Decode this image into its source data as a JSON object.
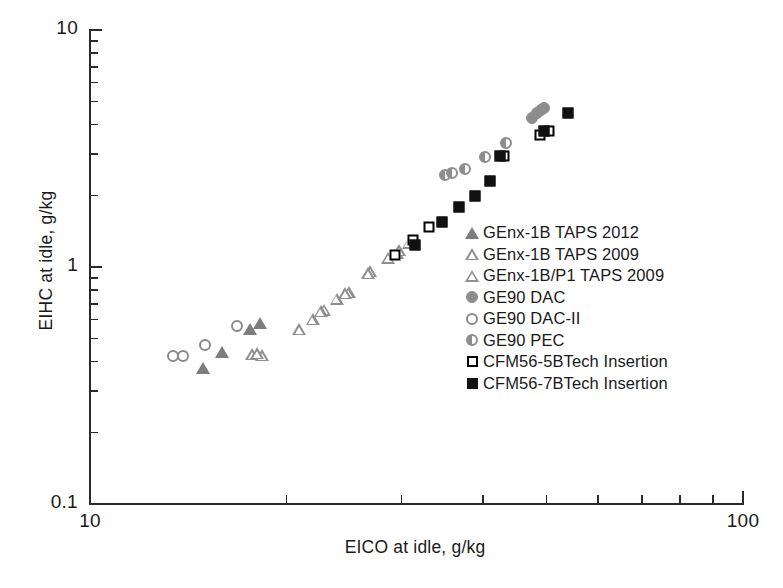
{
  "chart_data": {
    "type": "scatter",
    "title": "",
    "xlabel": "EICO at idle, g/kg",
    "ylabel": "EIHC at idle, g/kg",
    "xscale": "log",
    "yscale": "log",
    "xlim": [
      10,
      100
    ],
    "ylim": [
      0.1,
      10
    ],
    "grid": false,
    "legend_position": "center-right",
    "x_tick_labels": [
      "10",
      "100"
    ],
    "x_tick_values": [
      10,
      100
    ],
    "x_minor_ticks": [
      20,
      30,
      40,
      50,
      60,
      70,
      80,
      90
    ],
    "y_tick_labels": [
      "10",
      "1",
      "0.1"
    ],
    "y_tick_values": [
      10,
      1,
      0.1
    ],
    "y_minor_ticks": [
      0.2,
      0.3,
      0.4,
      0.5,
      0.6,
      0.7,
      0.8,
      0.9,
      2,
      3,
      4,
      5,
      6,
      7,
      8,
      9
    ],
    "series": [
      {
        "name": "GEnx-1B TAPS 2012",
        "marker": "triangle-filled",
        "color": "#7d7d7d",
        "points": [
          [
            14.9,
            0.375
          ],
          [
            15.9,
            0.44
          ],
          [
            17.6,
            0.55
          ],
          [
            18.2,
            0.58
          ]
        ]
      },
      {
        "name": "GEnx-1B TAPS 2009",
        "marker": "triangle-open",
        "color": "#8f8f8f",
        "points": [
          [
            17.3,
            0.455
          ],
          [
            17.9,
            0.45
          ],
          [
            20.4,
            0.58
          ],
          [
            21.4,
            0.64
          ],
          [
            22.3,
            0.7
          ],
          [
            23.3,
            0.78
          ],
          [
            24.3,
            0.83
          ],
          [
            26.2,
            1.02
          ],
          [
            27.9,
            1.16
          ],
          [
            30.0,
            1.34
          ]
        ]
      },
      {
        "name": "GEnx-1B/P1 TAPS 2009",
        "marker": "triangle-open",
        "color": "#8f8f8f",
        "points": [
          [
            17.6,
            0.46
          ],
          [
            22.0,
            0.69
          ],
          [
            24.0,
            0.82
          ],
          [
            26.0,
            1.0
          ],
          [
            28.8,
            1.22
          ],
          [
            29.0,
            1.25
          ]
        ]
      },
      {
        "name": "GE90 DAC",
        "marker": "circle-filled",
        "color": "#8d8d8d",
        "points": [
          [
            47.5,
            4.25
          ],
          [
            48.3,
            4.45
          ],
          [
            49.0,
            4.6
          ],
          [
            49.6,
            4.7
          ]
        ]
      },
      {
        "name": "GE90 DAC-II",
        "marker": "circle-open",
        "color": "#8a8a8a",
        "points": [
          [
            13.4,
            0.42
          ],
          [
            13.9,
            0.42
          ],
          [
            15.0,
            0.47
          ],
          [
            16.8,
            0.565
          ]
        ]
      },
      {
        "name": "GE90 PEC",
        "marker": "circle-half",
        "color": "#8d8d8d",
        "points": [
          [
            35.0,
            2.45
          ],
          [
            35.8,
            2.5
          ],
          [
            37.5,
            2.6
          ],
          [
            40.3,
            2.9
          ],
          [
            43.3,
            3.35
          ]
        ]
      },
      {
        "name": "CFM56-5BTech Insertion",
        "marker": "square-open",
        "color": "#000000",
        "points": [
          [
            29.3,
            1.12
          ],
          [
            31.2,
            1.3
          ],
          [
            33.1,
            1.47
          ],
          [
            43.0,
            2.95
          ],
          [
            48.8,
            3.6
          ],
          [
            50.5,
            3.75
          ]
        ]
      },
      {
        "name": "CFM56-7BTech Insertion",
        "marker": "square-filled",
        "color": "#111111",
        "points": [
          [
            31.5,
            1.24
          ],
          [
            34.6,
            1.55
          ],
          [
            36.8,
            1.8
          ],
          [
            38.8,
            2.0
          ],
          [
            41.0,
            2.3
          ],
          [
            42.4,
            2.95
          ],
          [
            49.5,
            3.75
          ],
          [
            54.0,
            4.45
          ]
        ]
      }
    ]
  },
  "legend": {
    "entries": [
      {
        "label": "GEnx-1B TAPS 2012",
        "marker": "triangle-filled"
      },
      {
        "label": "GEnx-1B TAPS 2009",
        "marker": "triangle-open"
      },
      {
        "label": "GEnx-1B/P1 TAPS 2009",
        "marker": "triangle-open"
      },
      {
        "label": "GE90 DAC",
        "marker": "circle-filled"
      },
      {
        "label": "GE90 DAC-II",
        "marker": "circle-open"
      },
      {
        "label": "GE90 PEC",
        "marker": "circle-half"
      },
      {
        "label": "CFM56-5BTech Insertion",
        "marker": "square-open"
      },
      {
        "label": "CFM56-7BTech Insertion",
        "marker": "square-filled"
      }
    ]
  }
}
